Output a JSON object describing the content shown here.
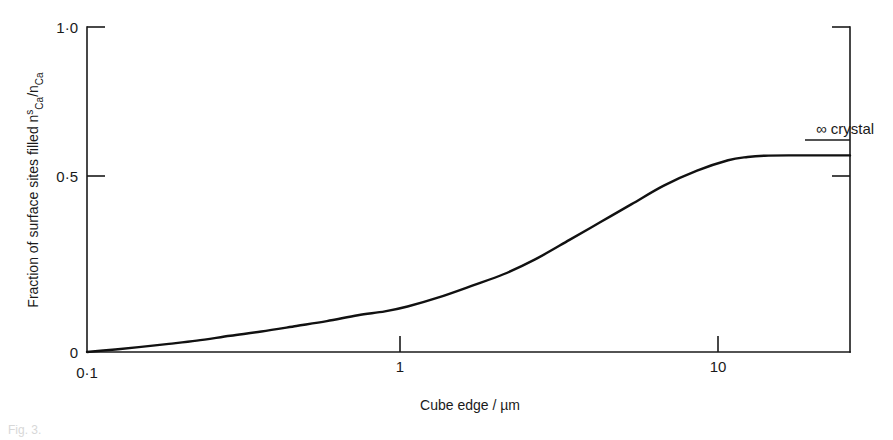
{
  "figure": {
    "background_color": "#ffffff",
    "line_color": "#1a1a1a",
    "curve_color": "#111111"
  },
  "chart_data": {
    "type": "line",
    "title": "",
    "subtitle": "",
    "xlabel": "Cube edge / µm",
    "ylabel": "Fraction of surface sites filled nᴿₐ / nₐ",
    "ylabel_parts": {
      "prefix": "Fraction of surface sites filled ",
      "numerator_base": "n",
      "numerator_sup": "s",
      "numerator_sub": "Ca",
      "divider": "/",
      "denominator_base": "n",
      "denominator_sub": "Ca"
    },
    "xscale": "log",
    "yscale": "linear",
    "xlim": [
      0.1,
      24.0
    ],
    "ylim": [
      0.0,
      1.0
    ],
    "grid": false,
    "legend": "none",
    "xticks": [
      0.1,
      1,
      10
    ],
    "xtick_labels": [
      "0·1",
      "1",
      "10"
    ],
    "yticks": [
      0,
      0.5,
      1.0
    ],
    "ytick_labels": [
      "0",
      "0·5",
      "1·0"
    ],
    "right_axis_ticks": [
      0.5,
      0.65
    ],
    "series": [
      {
        "name": "fraction of surface sites filled",
        "x": [
          0.1,
          0.12,
          0.145,
          0.18,
          0.22,
          0.28,
          0.35,
          0.45,
          0.56,
          0.7,
          0.85,
          1.0,
          1.25,
          1.6,
          2.0,
          2.5,
          3.2,
          4.0,
          5.0,
          6.3,
          8.0,
          10.0,
          11.5,
          13.0,
          16.0,
          20.0,
          24.0
        ],
        "y": [
          0.0,
          0.007,
          0.015,
          0.025,
          0.035,
          0.05,
          0.063,
          0.08,
          0.095,
          0.113,
          0.125,
          0.14,
          0.168,
          0.205,
          0.24,
          0.285,
          0.345,
          0.4,
          0.455,
          0.512,
          0.558,
          0.59,
          0.6,
          0.604,
          0.605,
          0.605,
          0.605
        ]
      }
    ],
    "annotations": [
      {
        "name": "infinite-crystal",
        "symbol": "∞",
        "text": "∞ crystal",
        "value": 0.65,
        "description": "marker line on right axis indicating value for an infinite crystal"
      }
    ]
  },
  "caption": {
    "fragment": "Fig. 3."
  }
}
